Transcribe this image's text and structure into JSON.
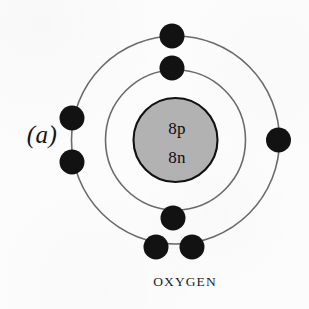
{
  "figure": {
    "panel_label": "(a)",
    "element_caption": "OXYGEN",
    "background_color": "#fcfcfc"
  },
  "atom": {
    "center": {
      "x": 175.5,
      "y": 140
    },
    "nucleus": {
      "radius": 42,
      "fill_color": "#b2b2b2",
      "stroke_color": "#111111",
      "protons_label": "8p",
      "neutrons_label": "8n"
    },
    "shells": [
      {
        "name": "inner-shell",
        "index": 1,
        "radius": 70,
        "electron_count": 2,
        "stroke_color": "#6b6b6b"
      },
      {
        "name": "outer-shell",
        "index": 2,
        "radius": 104,
        "electron_count": 6,
        "stroke_color": "#6b6b6b"
      }
    ],
    "electron": {
      "radius": 12.5,
      "fill_color": "#121212"
    },
    "electrons": [
      {
        "shell": 1,
        "name": "electron-inner-top",
        "x": 172,
        "y": 68
      },
      {
        "shell": 1,
        "name": "electron-inner-bottom",
        "x": 173,
        "y": 218
      },
      {
        "shell": 2,
        "name": "electron-outer-top",
        "x": 172,
        "y": 36
      },
      {
        "shell": 2,
        "name": "electron-outer-right",
        "x": 278.5,
        "y": 140
      },
      {
        "shell": 2,
        "name": "electron-outer-left-upper",
        "x": 72,
        "y": 118
      },
      {
        "shell": 2,
        "name": "electron-outer-left-lower",
        "x": 72,
        "y": 162
      },
      {
        "shell": 2,
        "name": "electron-outer-bottom-left",
        "x": 156,
        "y": 247
      },
      {
        "shell": 2,
        "name": "electron-outer-bottom-right",
        "x": 192,
        "y": 247
      }
    ]
  }
}
